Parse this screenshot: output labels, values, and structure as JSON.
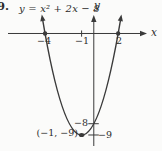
{
  "page": {
    "exercise_number": "9."
  },
  "chart_data": {
    "type": "line",
    "title": "y = x² + 2x − 8",
    "xlabel": "x",
    "ylabel": "y",
    "equation_coefficients": {
      "a": 1,
      "b": 2,
      "c": -8
    },
    "x_intercepts": [
      -4,
      2
    ],
    "y_intercept": -8,
    "vertex": {
      "x": -1,
      "y": -9,
      "label": "(−1, −9)"
    },
    "x_ticks": [
      {
        "value": -4,
        "label": "−4",
        "style": "dot"
      },
      {
        "value": -1,
        "label": "−1",
        "style": "tick"
      },
      {
        "value": 2,
        "label": "2",
        "style": "dot"
      }
    ],
    "y_ticks": [
      {
        "value": -8,
        "label": "−8",
        "style": "tick"
      },
      {
        "value": -9,
        "label": "−9",
        "style": "tick"
      }
    ],
    "curve_x_range": [
      -4.2,
      2.2
    ],
    "xlim": [
      -7.7,
      5.6
    ],
    "ylim": [
      -10.42,
      2.97
    ],
    "grid": false,
    "legend": false,
    "ink_color": "#3a3a3a",
    "background_color": "#fbfbfa"
  }
}
